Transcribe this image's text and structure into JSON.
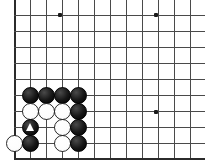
{
  "board": {
    "kind": "go-board-diagram",
    "description": "Go board corner position, lower-left, with black and white stones and one marked black stone",
    "grid": {
      "spacing": 16,
      "x_positions": [
        14,
        30,
        46,
        62,
        78,
        94,
        110,
        126,
        142,
        158,
        174,
        190,
        206
      ],
      "y_positions": [
        15,
        31,
        47,
        63,
        79,
        95,
        111,
        127,
        143,
        158
      ],
      "left_edge_x": 14,
      "bottom_edge_y": 158,
      "top_visible_y": 15,
      "line_color": "#4a4a4a",
      "edge_color": "#2b2b2b",
      "background_color": "#ffffff"
    },
    "star_points": [
      {
        "x": 59,
        "y": 14
      },
      {
        "x": 155,
        "y": 14
      },
      {
        "x": 155,
        "y": 111
      }
    ],
    "stones": [
      {
        "color": "black",
        "x": 30,
        "y": 95,
        "mark": ""
      },
      {
        "color": "black",
        "x": 46,
        "y": 95,
        "mark": ""
      },
      {
        "color": "black",
        "x": 62,
        "y": 95,
        "mark": ""
      },
      {
        "color": "black",
        "x": 78,
        "y": 95,
        "mark": ""
      },
      {
        "color": "white",
        "x": 30,
        "y": 111,
        "mark": ""
      },
      {
        "color": "white",
        "x": 46,
        "y": 111,
        "mark": ""
      },
      {
        "color": "white",
        "x": 62,
        "y": 111,
        "mark": ""
      },
      {
        "color": "black",
        "x": 78,
        "y": 111,
        "mark": ""
      },
      {
        "color": "black",
        "x": 30,
        "y": 127,
        "mark": "triangle"
      },
      {
        "color": "white",
        "x": 62,
        "y": 127,
        "mark": ""
      },
      {
        "color": "black",
        "x": 78,
        "y": 127,
        "mark": ""
      },
      {
        "color": "white",
        "x": 14,
        "y": 143,
        "mark": ""
      },
      {
        "color": "black",
        "x": 30,
        "y": 143,
        "mark": ""
      },
      {
        "color": "white",
        "x": 62,
        "y": 143,
        "mark": ""
      },
      {
        "color": "black",
        "x": 78,
        "y": 143,
        "mark": ""
      }
    ],
    "colors": {
      "black_stone": "#000000",
      "white_stone": "#ffffff",
      "mark": "#ffffff"
    }
  }
}
